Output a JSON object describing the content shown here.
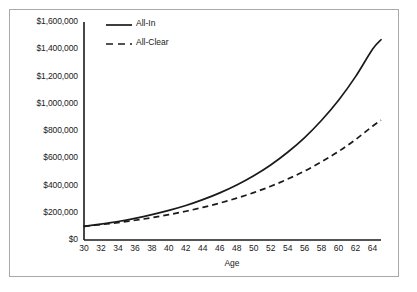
{
  "chart_data": {
    "type": "line",
    "title": "",
    "xlabel": "Age",
    "ylabel": "",
    "grid": false,
    "legend_position": "upper-left-inside",
    "xlim": [
      30,
      65
    ],
    "ylim": [
      0,
      1600000
    ],
    "x": [
      30,
      32,
      34,
      36,
      38,
      40,
      42,
      44,
      46,
      48,
      50,
      52,
      54,
      56,
      58,
      60,
      62,
      64,
      65
    ],
    "xtick_labels": [
      "30",
      "32",
      "34",
      "36",
      "38",
      "40",
      "42",
      "44",
      "46",
      "48",
      "50",
      "52",
      "54",
      "56",
      "58",
      "60",
      "62",
      "64"
    ],
    "xticks": [
      30,
      32,
      34,
      36,
      38,
      40,
      42,
      44,
      46,
      48,
      50,
      52,
      54,
      56,
      58,
      60,
      62,
      64
    ],
    "yticks": [
      0,
      200000,
      400000,
      600000,
      800000,
      1000000,
      1200000,
      1400000,
      1600000
    ],
    "ytick_labels": [
      "$0",
      "$200,000",
      "$400,000",
      "$600,000",
      "$800,000",
      "$1,000,000",
      "$1,200,000",
      "$1,400,000",
      "$1,600,000"
    ],
    "series": [
      {
        "name": "All-In",
        "style": "solid",
        "color": "#1a1a1a",
        "values": [
          100000,
          117000,
          136000,
          159000,
          186000,
          217000,
          253000,
          296000,
          346000,
          404000,
          472000,
          551000,
          644000,
          752000,
          879000,
          1026000,
          1199000,
          1400000,
          1470000
        ]
      },
      {
        "name": "All-Clear",
        "style": "dashed",
        "color": "#1a1a1a",
        "values": [
          100000,
          113000,
          128000,
          145000,
          164000,
          186000,
          211000,
          239000,
          271000,
          307000,
          348000,
          394000,
          447000,
          506000,
          574000,
          650000,
          737000,
          835000,
          880000
        ]
      }
    ]
  },
  "legend": {
    "items": [
      {
        "label": "All-In",
        "style": "solid"
      },
      {
        "label": "All-Clear",
        "style": "dashed"
      }
    ]
  },
  "axes": {
    "x_title": "Age"
  },
  "colors": {
    "frame": "#a9a9a9",
    "axis": "#1a1a1a",
    "text": "#1a1a1a",
    "background": "#ffffff"
  }
}
